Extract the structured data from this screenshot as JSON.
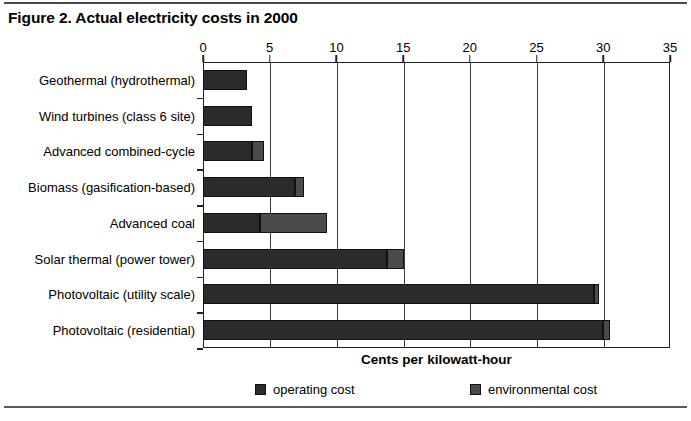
{
  "figure": {
    "title": "Figure 2. Actual electricity costs in 2000"
  },
  "legend": {
    "operating_label": "operating cost",
    "environmental_label": "environmental cost"
  },
  "colors": {
    "operating": "#2b2b2b",
    "environmental": "#4b4b4b",
    "axis": "#222222",
    "rule": "#4a4a4a"
  },
  "chart_data": {
    "type": "bar",
    "orientation": "horizontal",
    "stacked": true,
    "title": "Figure 2. Actual electricity costs in 2000",
    "xlabel": "Cents per kilowatt-hour",
    "ylabel": "",
    "xlim": [
      0,
      35
    ],
    "xticks": [
      0,
      5,
      10,
      15,
      20,
      25,
      30,
      35
    ],
    "xtick_labels": [
      "0",
      "5",
      "10",
      "15",
      "20",
      "25",
      "30",
      "35"
    ],
    "grid": true,
    "grid_axis": "x",
    "legend_position": "bottom",
    "x_axis_position": "top",
    "categories": [
      "Geothermal (hydrothermal)",
      "Wind turbines (class 6 site)",
      "Advanced combined-cycle",
      "Biomass (gasification-based)",
      "Advanced coal",
      "Solar thermal (power tower)",
      "Photovoltaic (utility scale)",
      "Photovoltaic (residential)"
    ],
    "series": [
      {
        "name": "operating cost",
        "color": "#2b2b2b",
        "values": [
          3.3,
          3.7,
          3.7,
          6.9,
          4.3,
          13.8,
          29.3,
          30.0
        ]
      },
      {
        "name": "environmental cost",
        "color": "#4b4b4b",
        "values": [
          0.0,
          0.0,
          0.9,
          0.7,
          5.0,
          1.3,
          0.4,
          0.5
        ]
      }
    ],
    "totals": [
      3.3,
      3.7,
      4.6,
      7.6,
      9.3,
      15.1,
      29.7,
      30.5
    ]
  }
}
